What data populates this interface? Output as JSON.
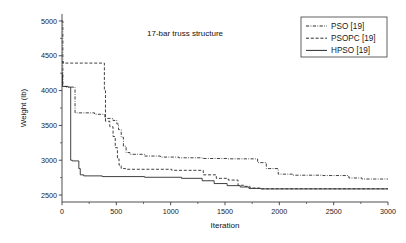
{
  "chart_data": {
    "type": "line",
    "title": "17-bar truss structure",
    "xlabel": "Iteration",
    "ylabel": "Weight (lb)",
    "xlim": [
      0,
      3000
    ],
    "ylim": [
      2400,
      5100
    ],
    "xticks": [
      0,
      500,
      1000,
      1500,
      2000,
      2500,
      3000
    ],
    "xticklabels": [
      "0",
      "500",
      "1000",
      "1500",
      "2000",
      "2500",
      "3000"
    ],
    "yticks": [
      2500,
      3000,
      3500,
      4000,
      4500,
      5000
    ],
    "yticklabels": [
      "2500",
      "3000",
      "3500",
      "4000",
      "4500",
      "5000"
    ],
    "grid": false,
    "legend_position": "top-right",
    "series": [
      {
        "name": "PSO [19]",
        "style": "dash-dot",
        "color": "#2b2b2b",
        "points": [
          [
            0,
            5000
          ],
          [
            8,
            5000
          ],
          [
            8,
            4060
          ],
          [
            40,
            4060
          ],
          [
            40,
            4050
          ],
          [
            120,
            4050
          ],
          [
            120,
            3680
          ],
          [
            300,
            3680
          ],
          [
            300,
            3660
          ],
          [
            395,
            3660
          ],
          [
            395,
            3600
          ],
          [
            470,
            3600
          ],
          [
            470,
            3570
          ],
          [
            505,
            3570
          ],
          [
            505,
            3520
          ],
          [
            520,
            3520
          ],
          [
            520,
            3440
          ],
          [
            545,
            3440
          ],
          [
            545,
            3330
          ],
          [
            565,
            3330
          ],
          [
            565,
            3200
          ],
          [
            590,
            3200
          ],
          [
            590,
            3110
          ],
          [
            625,
            3110
          ],
          [
            625,
            3085
          ],
          [
            760,
            3085
          ],
          [
            760,
            3060
          ],
          [
            905,
            3060
          ],
          [
            905,
            3045
          ],
          [
            1075,
            3045
          ],
          [
            1075,
            3035
          ],
          [
            1290,
            3035
          ],
          [
            1290,
            3025
          ],
          [
            1520,
            3025
          ],
          [
            1520,
            3020
          ],
          [
            1800,
            3020
          ],
          [
            1800,
            2965
          ],
          [
            1880,
            2965
          ],
          [
            1880,
            2880
          ],
          [
            1990,
            2880
          ],
          [
            1990,
            2800
          ],
          [
            2120,
            2800
          ],
          [
            2120,
            2785
          ],
          [
            2400,
            2785
          ],
          [
            2400,
            2780
          ],
          [
            2640,
            2780
          ],
          [
            2640,
            2745
          ],
          [
            2760,
            2745
          ],
          [
            2760,
            2730
          ],
          [
            3000,
            2730
          ]
        ]
      },
      {
        "name": "PSOPC [19]",
        "style": "dashed",
        "color": "#2b2b2b",
        "points": [
          [
            0,
            4415
          ],
          [
            12,
            4415
          ],
          [
            12,
            4395
          ],
          [
            390,
            4395
          ],
          [
            390,
            4000
          ],
          [
            400,
            4000
          ],
          [
            400,
            3560
          ],
          [
            440,
            3560
          ],
          [
            440,
            3480
          ],
          [
            470,
            3480
          ],
          [
            470,
            3340
          ],
          [
            490,
            3340
          ],
          [
            490,
            3180
          ],
          [
            510,
            3180
          ],
          [
            510,
            3020
          ],
          [
            525,
            3020
          ],
          [
            525,
            2930
          ],
          [
            545,
            2930
          ],
          [
            545,
            2880
          ],
          [
            585,
            2880
          ],
          [
            585,
            2870
          ],
          [
            1010,
            2870
          ],
          [
            1010,
            2855
          ],
          [
            1300,
            2855
          ],
          [
            1300,
            2790
          ],
          [
            1420,
            2790
          ],
          [
            1420,
            2740
          ],
          [
            1530,
            2740
          ],
          [
            1530,
            2715
          ],
          [
            1620,
            2715
          ],
          [
            1620,
            2640
          ],
          [
            1680,
            2640
          ],
          [
            1680,
            2625
          ],
          [
            1730,
            2625
          ],
          [
            1730,
            2600
          ],
          [
            1820,
            2600
          ],
          [
            1820,
            2590
          ],
          [
            3000,
            2590
          ]
        ]
      },
      {
        "name": "HPSO [19]",
        "style": "solid",
        "color": "#2b2b2b",
        "points": [
          [
            0,
            4250
          ],
          [
            5,
            4250
          ],
          [
            5,
            4060
          ],
          [
            55,
            4060
          ],
          [
            55,
            4050
          ],
          [
            80,
            4050
          ],
          [
            80,
            3000
          ],
          [
            95,
            3000
          ],
          [
            95,
            2990
          ],
          [
            155,
            2990
          ],
          [
            155,
            2880
          ],
          [
            168,
            2880
          ],
          [
            168,
            2790
          ],
          [
            200,
            2790
          ],
          [
            200,
            2775
          ],
          [
            370,
            2775
          ],
          [
            370,
            2765
          ],
          [
            760,
            2765
          ],
          [
            760,
            2755
          ],
          [
            1100,
            2755
          ],
          [
            1100,
            2740
          ],
          [
            1290,
            2740
          ],
          [
            1290,
            2705
          ],
          [
            1400,
            2705
          ],
          [
            1400,
            2665
          ],
          [
            1520,
            2665
          ],
          [
            1520,
            2635
          ],
          [
            1640,
            2635
          ],
          [
            1640,
            2615
          ],
          [
            1720,
            2615
          ],
          [
            1720,
            2595
          ],
          [
            1830,
            2595
          ],
          [
            1830,
            2588
          ],
          [
            3000,
            2588
          ]
        ]
      }
    ]
  },
  "legend": {
    "items": [
      {
        "label": "PSO [19]",
        "style": "dash-dot"
      },
      {
        "label": "PSOPC [19]",
        "style": "dashed"
      },
      {
        "label": "HPSO [19]",
        "style": "solid"
      }
    ]
  }
}
